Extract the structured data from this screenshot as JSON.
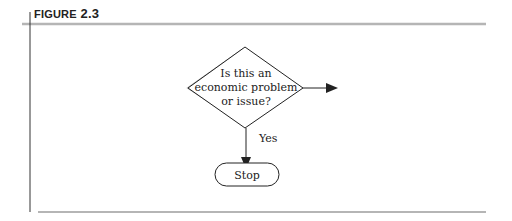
{
  "figure": {
    "label_prefix": "FIGURE",
    "label_number": "2.3"
  },
  "flowchart": {
    "decision": {
      "lines": [
        "Is this an",
        "economic problem",
        "or issue?"
      ]
    },
    "yes_label": "Yes",
    "terminal": {
      "label": "Stop"
    }
  },
  "colors": {
    "rule": "#b5b5b5",
    "stroke": "#222222",
    "shadow": "#a8a8a8"
  }
}
